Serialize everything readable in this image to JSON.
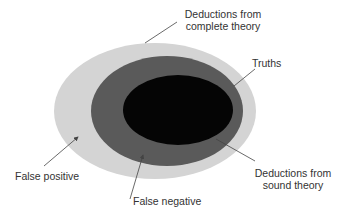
{
  "diagram": {
    "regions": [
      {
        "name": "deductions-complete-theory",
        "color": "#d4d4d4"
      },
      {
        "name": "truths",
        "color": "#5a5a5a"
      },
      {
        "name": "deductions-sound-theory",
        "color": "#050505"
      }
    ],
    "labels": {
      "complete_line1": "Deductions from",
      "complete_line2": "complete theory",
      "truths": "Truths",
      "sound_line1": "Deductions from",
      "sound_line2": "sound theory",
      "false_positive": "False positive",
      "false_negative": "False negative"
    },
    "line_color": "#444444"
  }
}
